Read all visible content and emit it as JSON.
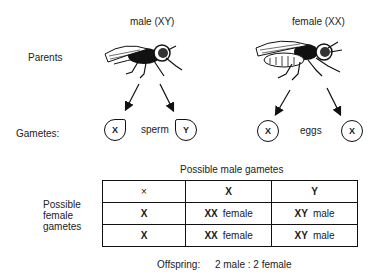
{
  "labels": {
    "parents": "Parents",
    "gametes": "Gametes:",
    "male_parent": "male (XY)",
    "female_parent": "female (XX)",
    "sperm": "sperm",
    "eggs": "eggs"
  },
  "gametes": {
    "male": [
      "X",
      "Y"
    ],
    "female": [
      "X",
      "X"
    ]
  },
  "punnett": {
    "column_title": "Possible male gametes",
    "row_title_lines": [
      "Possible",
      "female",
      "gametes"
    ],
    "corner": "×",
    "header": [
      "X",
      "Y"
    ],
    "rows": [
      {
        "row_label": "X",
        "cells": [
          {
            "genotype": "XX",
            "sex": "female"
          },
          {
            "genotype": "XY",
            "sex": "male"
          }
        ]
      },
      {
        "row_label": "X",
        "cells": [
          {
            "genotype": "XX",
            "sex": "female"
          },
          {
            "genotype": "XY",
            "sex": "male"
          }
        ]
      }
    ]
  },
  "offspring": {
    "label": "Offspring:",
    "ratio": "2 male : 2 female"
  }
}
